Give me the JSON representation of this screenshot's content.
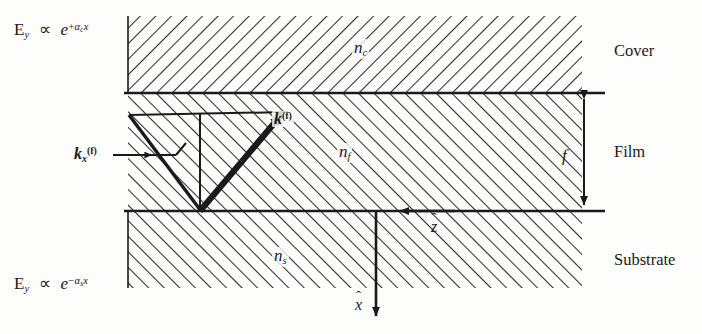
{
  "figure": {
    "regions": {
      "cover": {
        "side_label": "Cover",
        "index_label": "n",
        "index_sub": "c"
      },
      "film": {
        "side_label": "Film",
        "index_label": "n",
        "index_sub": "f"
      },
      "substrate": {
        "side_label": "Substrate",
        "index_label": "n",
        "index_sub": "s"
      }
    },
    "field_decay": {
      "cover": {
        "lhs": "E",
        "lhs_sub": "y",
        "prop": "∝",
        "base": "e",
        "exp_sign": "+",
        "exp_alpha": "α",
        "exp_sub": "c",
        "exp_var": "x"
      },
      "substrate": {
        "lhs": "E",
        "lhs_sub": "y",
        "prop": "∝",
        "base": "e",
        "exp_sign": "−",
        "exp_alpha": "α",
        "exp_sub": "s",
        "exp_var": "x"
      }
    },
    "vectors": {
      "k_film": {
        "symbol": "k",
        "sup": "(f)"
      },
      "k_x_film": {
        "symbol": "k",
        "sub": "x",
        "sup": "(f)"
      },
      "z_hat": {
        "symbol": "z",
        "hat": "ˆ"
      },
      "x_hat": {
        "symbol": "x",
        "hat": "ˆ"
      }
    },
    "dimension": {
      "thickness_label": "f"
    },
    "colors": {
      "ink": "#1a1a1a",
      "paper": "#fdfdfc",
      "hatch": "#2b2b2b"
    }
  }
}
